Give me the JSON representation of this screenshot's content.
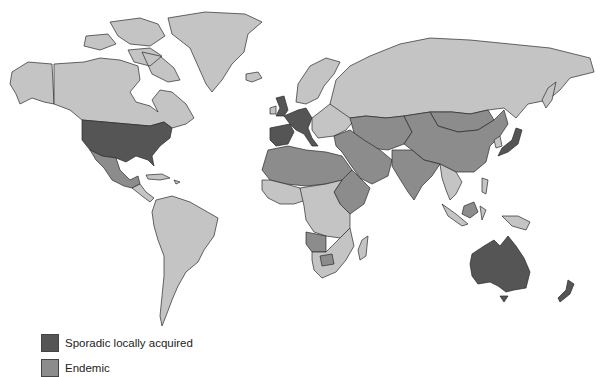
{
  "map": {
    "type": "choropleth-world",
    "colors": {
      "sporadic": "#555555",
      "endemic": "#8c8c8c",
      "none": "#c4c4c4",
      "border": "#2a2a2a",
      "water": "#ffffff"
    },
    "regions": {
      "sporadic_locally_acquired": [
        "United States",
        "United Kingdom",
        "France",
        "Spain",
        "Portugal",
        "Germany",
        "Italy",
        "Japan",
        "Australia",
        "New Zealand"
      ],
      "endemic": [
        "Mexico",
        "North Africa",
        "Sahel",
        "Middle East",
        "Central Asia",
        "China",
        "Mongolia",
        "India",
        "Ethiopia",
        "Angola",
        "Botswana"
      ],
      "no_data_or_other": [
        "Canada",
        "Greenland",
        "Russia",
        "South America",
        "Southern Africa",
        "Scandinavia",
        "Eastern Europe"
      ]
    }
  },
  "legend": {
    "items": [
      {
        "label": "Sporadic locally acquired",
        "color": "#555555"
      },
      {
        "label": "Endemic",
        "color": "#8c8c8c"
      }
    ]
  }
}
